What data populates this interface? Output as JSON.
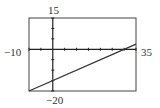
{
  "chart_data": {
    "type": "line",
    "title": "",
    "xlabel": "",
    "ylabel": "",
    "xlim": [
      -10,
      35
    ],
    "ylim": [
      -20,
      15
    ],
    "xscale": 5,
    "yscale": 5,
    "grid": false,
    "window_labels": {
      "xmin": "−10",
      "xmax": "35",
      "ymin": "−20",
      "ymax": "15"
    },
    "series": [
      {
        "name": "y = 0.5x − 15",
        "slope": 0.5,
        "intercept": -15,
        "points": [
          [
            -10,
            -20
          ],
          [
            0,
            -15
          ],
          [
            30,
            0
          ],
          [
            35,
            2.5
          ]
        ]
      }
    ]
  },
  "colors": {
    "axis": "#222222",
    "line": "#333333",
    "frame": "#444444"
  }
}
